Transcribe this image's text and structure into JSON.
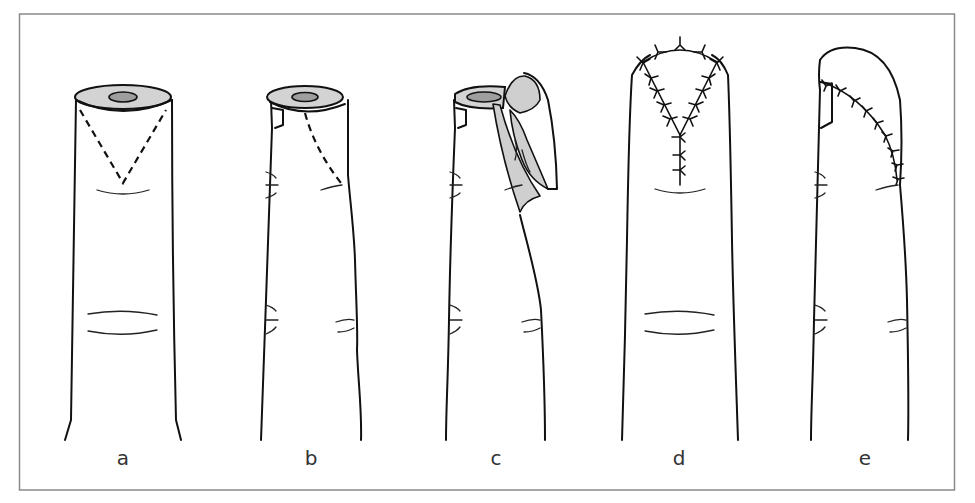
{
  "figure": {
    "panels": [
      {
        "id": "a",
        "label": "a",
        "content": "Fingertip amputation stump with V-shaped dashed incision marked (dorsal/volar view)"
      },
      {
        "id": "b",
        "label": "b",
        "content": "Lateral view showing dashed incision line"
      },
      {
        "id": "c",
        "label": "c",
        "content": "Triangular flap elevated and advanced over stump"
      },
      {
        "id": "d",
        "label": "d",
        "content": "Flap sutured in Y configuration (frontal view)"
      },
      {
        "id": "e",
        "label": "e",
        "content": "Sutured flap, lateral view"
      }
    ]
  },
  "colors": {
    "frame": "#8a8a8a",
    "line": "#111111",
    "bone_ring": "#d3d3d3",
    "bone_core": "#9e9e9e",
    "flap": "#cfcfcf",
    "label": "#333333"
  }
}
